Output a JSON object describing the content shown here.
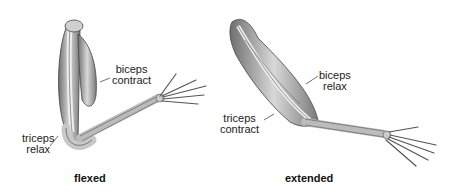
{
  "diagram": {
    "panels": [
      {
        "id": "flexed",
        "caption": "flexed",
        "labels": [
          {
            "line1": "biceps",
            "line2": "contract"
          },
          {
            "line1": "triceps",
            "line2": "relax"
          }
        ]
      },
      {
        "id": "extended",
        "caption": "extended",
        "labels": [
          {
            "line1": "biceps",
            "line2": "relax"
          },
          {
            "line1": "triceps",
            "line2": "contract"
          }
        ]
      }
    ]
  }
}
